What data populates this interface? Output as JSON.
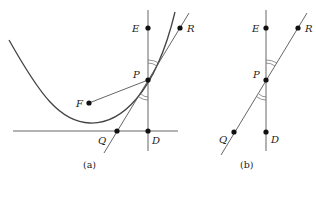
{
  "figure_a": {
    "caption": "(a)",
    "labels": {
      "E": "E",
      "R": "R",
      "P": "P",
      "F": "F",
      "Q": "Q",
      "D": "D"
    }
  },
  "figure_b": {
    "caption": "(b)",
    "labels": {
      "E": "E",
      "R": "R",
      "P": "P",
      "Q": "Q",
      "D": "D"
    }
  },
  "colors": {
    "stroke": "#333333",
    "curve": "#444444",
    "point": "#111111"
  }
}
